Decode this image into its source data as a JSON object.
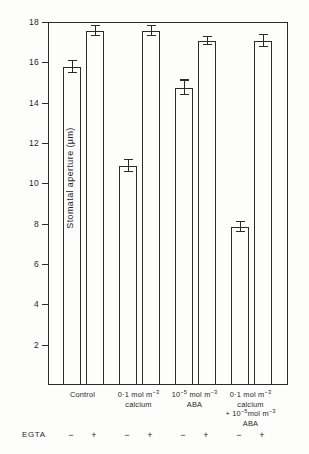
{
  "figure": {
    "background_color": "#fdfdfc",
    "ink_color": "#2b2b2b"
  },
  "axis": {
    "y_title": "Stomatal aperture (µm)",
    "y_ticks": [
      "18",
      "16",
      "14",
      "12",
      "10",
      "8",
      "6",
      "4",
      "2"
    ],
    "y_min": 0,
    "y_max": 18
  },
  "egta": {
    "label": "EGTA",
    "signs": [
      "−",
      "+",
      "−",
      "+",
      "−",
      "+",
      "−",
      "+"
    ]
  },
  "groups": [
    {
      "id": "control",
      "lines": [
        "Control"
      ]
    },
    {
      "id": "calcium",
      "lines": [
        "0·1 mol m⁻³",
        "calcium"
      ]
    },
    {
      "id": "aba",
      "lines": [
        "10⁻⁵ mol m⁻³",
        "ABA"
      ]
    },
    {
      "id": "calcium-plus-aba",
      "lines": [
        "0·1 mol m⁻³",
        "calcium",
        "+ 10⁻⁵mol m⁻³",
        "ABA"
      ]
    }
  ],
  "chart_data": {
    "type": "bar",
    "title": "",
    "xlabel": "",
    "ylabel": "Stomatal aperture (µm)",
    "ylim": [
      0,
      18
    ],
    "grid": false,
    "legend": "none",
    "categories": [
      "Control −EGTA",
      "Control +EGTA",
      "0·1 mol m⁻³ calcium −EGTA",
      "0·1 mol m⁻³ calcium +EGTA",
      "10⁻⁵ mol m⁻³ ABA −EGTA",
      "10⁻⁵ mol m⁻³ ABA +EGTA",
      "0·1 mol m⁻³ calcium + 10⁻⁵ mol m⁻³ ABA −EGTA",
      "0·1 mol m⁻³ calcium + 10⁻⁵ mol m⁻³ ABA +EGTA"
    ],
    "values": [
      15.7,
      17.5,
      10.8,
      17.5,
      14.7,
      17.0,
      7.8,
      17.0
    ],
    "errors": [
      0.3,
      0.25,
      0.3,
      0.25,
      0.35,
      0.2,
      0.25,
      0.3
    ],
    "error_type": "standard error",
    "bars": [
      {
        "name": "control-minus-egta",
        "value": 15.7,
        "error": 0.3,
        "x": 14,
        "width": 18
      },
      {
        "name": "control-plus-egta",
        "value": 17.5,
        "error": 0.25,
        "x": 37,
        "width": 18
      },
      {
        "name": "calcium-minus-egta",
        "value": 10.8,
        "error": 0.3,
        "x": 70,
        "width": 18
      },
      {
        "name": "calcium-plus-egta",
        "value": 17.5,
        "error": 0.25,
        "x": 93,
        "width": 18
      },
      {
        "name": "aba-minus-egta",
        "value": 14.7,
        "error": 0.35,
        "x": 126,
        "width": 18
      },
      {
        "name": "aba-plus-egta",
        "value": 17.0,
        "error": 0.2,
        "x": 149,
        "width": 18
      },
      {
        "name": "calcium-aba-minus-egta",
        "value": 7.8,
        "error": 0.25,
        "x": 182,
        "width": 18
      },
      {
        "name": "calcium-aba-plus-egta",
        "value": 17.0,
        "error": 0.3,
        "x": 205,
        "width": 18
      }
    ]
  }
}
